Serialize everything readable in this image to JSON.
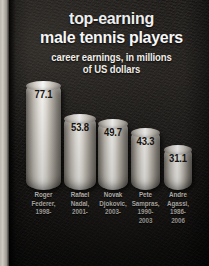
{
  "chart_data": {
    "type": "bar",
    "title": "top-earning male tennis players",
    "title_lines": [
      "top-earning",
      "male tennis players"
    ],
    "subtitle": "career earnings, in millions of US dollars",
    "subtitle_lines": [
      "career earnings, in millions",
      "of US dollars"
    ],
    "xlabel": "",
    "ylabel": "career earnings (millions of US dollars)",
    "ylim": [
      0,
      77.1
    ],
    "grid": false,
    "legend": "none",
    "categories": [
      "Roger Federer, 1998-",
      "Rafael Nadal, 2001-",
      "Novak Djokovic, 2003-",
      "Pete Sampras, 1990-2003",
      "Andre Agassi, 1986-2006"
    ],
    "values": [
      77.1,
      53.8,
      49.7,
      43.3,
      31.1
    ],
    "points": [
      {
        "player": "Roger Federer",
        "years": "1998-",
        "value": 77.1,
        "value_label": "77.1",
        "label_lines": [
          "Roger",
          "Federer,",
          "1998-"
        ]
      },
      {
        "player": "Rafael Nadal",
        "years": "2001-",
        "value": 53.8,
        "value_label": "53.8",
        "label_lines": [
          "Rafael",
          "Nadal,",
          "2001-"
        ]
      },
      {
        "player": "Novak Djokovic",
        "years": "2003-",
        "value": 49.7,
        "value_label": "49.7",
        "label_lines": [
          "Novak",
          "Djokovic,",
          "2003-"
        ]
      },
      {
        "player": "Pete Sampras",
        "years": "1990-2003",
        "value": 43.3,
        "value_label": "43.3",
        "label_lines": [
          "Pete",
          "Sampras,",
          "1990-",
          "2003"
        ]
      },
      {
        "player": "Andre Agassi",
        "years": "1986-2006",
        "value": 31.1,
        "value_label": "31.1",
        "label_lines": [
          "Andre",
          "Agassi,",
          "1986-",
          "2006"
        ]
      }
    ]
  },
  "colors": {
    "background": "#1b1917",
    "title_text": "#ffffff",
    "subtitle_text": "#f2efe9",
    "category_text": "#d6d2ca",
    "value_text": "#171513",
    "bar_highlight": "#fcfbf8",
    "bar_shadow": "#67635c",
    "page_edge": "#cfcac1"
  }
}
